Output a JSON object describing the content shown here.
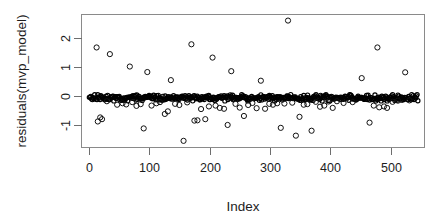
{
  "chart_data": {
    "type": "scatter",
    "title": "",
    "subtitle": "",
    "xlabel": "Index",
    "ylabel": "residuals(mvp_model)",
    "xlim": [
      -12,
      556
    ],
    "ylim": [
      -1.78,
      2.82
    ],
    "xticks": [
      0,
      100,
      200,
      300,
      400,
      500
    ],
    "xtick_labels": [
      "0",
      "100",
      "200",
      "300",
      "400",
      "500"
    ],
    "yticks": [
      2,
      1,
      0,
      -1
    ],
    "ytick_labels": [
      "2",
      "1",
      "0",
      "-1"
    ],
    "grid": false,
    "legend": null,
    "point_marker": "open-circle",
    "point_color": "#111111",
    "box_color": "#8a8a8a",
    "background": "#ffffff",
    "n_points": 545,
    "dense_band": {
      "x_start": 1,
      "x_end": 545,
      "y_center": -0.06,
      "y_spread": 0.11,
      "count": 430
    },
    "outliers": [
      {
        "x": 13,
        "y": 1.68
      },
      {
        "x": 15,
        "y": -0.88
      },
      {
        "x": 19,
        "y": -0.74
      },
      {
        "x": 22,
        "y": -0.8
      },
      {
        "x": 30,
        "y": -0.18
      },
      {
        "x": 35,
        "y": 1.45
      },
      {
        "x": 47,
        "y": -0.3
      },
      {
        "x": 56,
        "y": -0.25
      },
      {
        "x": 62,
        "y": -0.29
      },
      {
        "x": 68,
        "y": 1.02
      },
      {
        "x": 72,
        "y": -0.21
      },
      {
        "x": 79,
        "y": -0.34
      },
      {
        "x": 86,
        "y": -0.28
      },
      {
        "x": 91,
        "y": -1.12
      },
      {
        "x": 97,
        "y": 0.83
      },
      {
        "x": 104,
        "y": -0.33
      },
      {
        "x": 112,
        "y": -0.25
      },
      {
        "x": 118,
        "y": -0.21
      },
      {
        "x": 126,
        "y": -0.62
      },
      {
        "x": 131,
        "y": -0.53
      },
      {
        "x": 136,
        "y": 0.55
      },
      {
        "x": 143,
        "y": -0.27
      },
      {
        "x": 150,
        "y": -0.31
      },
      {
        "x": 157,
        "y": -1.55
      },
      {
        "x": 163,
        "y": -0.22
      },
      {
        "x": 170,
        "y": 1.79
      },
      {
        "x": 175,
        "y": -0.85
      },
      {
        "x": 180,
        "y": -0.84
      },
      {
        "x": 186,
        "y": -0.45
      },
      {
        "x": 193,
        "y": -0.8
      },
      {
        "x": 199,
        "y": -0.36
      },
      {
        "x": 205,
        "y": 1.33
      },
      {
        "x": 210,
        "y": -0.33
      },
      {
        "x": 217,
        "y": -0.41
      },
      {
        "x": 224,
        "y": -0.44
      },
      {
        "x": 230,
        "y": -1.0
      },
      {
        "x": 236,
        "y": 0.86
      },
      {
        "x": 243,
        "y": -0.27
      },
      {
        "x": 250,
        "y": -0.4
      },
      {
        "x": 257,
        "y": -0.69
      },
      {
        "x": 264,
        "y": -0.31
      },
      {
        "x": 271,
        "y": -0.24
      },
      {
        "x": 278,
        "y": -0.42
      },
      {
        "x": 285,
        "y": 0.53
      },
      {
        "x": 292,
        "y": -0.44
      },
      {
        "x": 299,
        "y": -0.27
      },
      {
        "x": 305,
        "y": -0.3
      },
      {
        "x": 312,
        "y": -0.25
      },
      {
        "x": 318,
        "y": -1.1
      },
      {
        "x": 324,
        "y": -0.26
      },
      {
        "x": 330,
        "y": 2.61
      },
      {
        "x": 337,
        "y": -0.23
      },
      {
        "x": 343,
        "y": -1.37
      },
      {
        "x": 349,
        "y": -0.72
      },
      {
        "x": 356,
        "y": -0.3
      },
      {
        "x": 362,
        "y": -0.28
      },
      {
        "x": 369,
        "y": -1.2
      },
      {
        "x": 376,
        "y": -0.2
      },
      {
        "x": 383,
        "y": -0.37
      },
      {
        "x": 390,
        "y": -0.33
      },
      {
        "x": 397,
        "y": -0.19
      },
      {
        "x": 404,
        "y": -0.41
      },
      {
        "x": 411,
        "y": -0.18
      },
      {
        "x": 422,
        "y": -0.24
      },
      {
        "x": 437,
        "y": -0.21
      },
      {
        "x": 452,
        "y": 0.62
      },
      {
        "x": 465,
        "y": -0.92
      },
      {
        "x": 472,
        "y": -0.33
      },
      {
        "x": 478,
        "y": 1.68
      },
      {
        "x": 481,
        "y": -0.39
      },
      {
        "x": 489,
        "y": -0.36
      },
      {
        "x": 494,
        "y": -0.41
      },
      {
        "x": 503,
        "y": -0.2
      },
      {
        "x": 512,
        "y": -0.16
      },
      {
        "x": 524,
        "y": 0.82
      },
      {
        "x": 531,
        "y": -0.15
      }
    ]
  }
}
